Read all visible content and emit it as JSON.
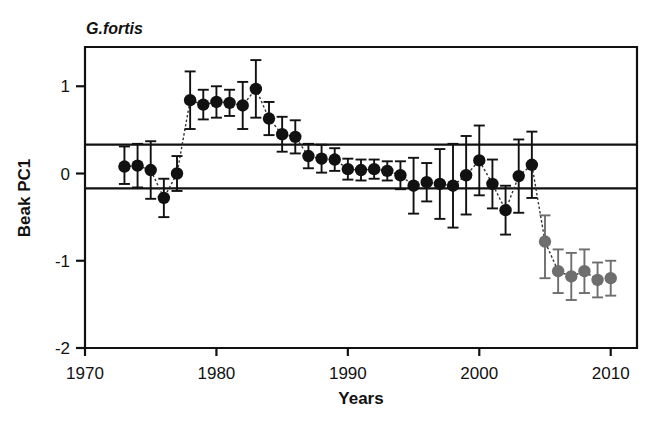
{
  "chart_data": {
    "type": "scatter",
    "title": "G.fortis",
    "xlabel": "Years",
    "ylabel": "Beak PC1",
    "xlim": [
      1970,
      2012
    ],
    "ylim": [
      -2,
      1.45
    ],
    "xticks": [
      1970,
      1980,
      1990,
      2000,
      2010
    ],
    "xtick_labels": [
      "1970",
      "1980",
      "1990",
      "2000",
      "2010"
    ],
    "yticks": [
      1,
      0,
      -1,
      -2
    ],
    "ytick_labels": [
      "1",
      "0",
      "-1",
      "-2"
    ],
    "grid": false,
    "legend": "none",
    "reference_lines": [
      {
        "name": "upper-reference-line",
        "y": 0.33
      },
      {
        "name": "lower-reference-line",
        "y": -0.17
      }
    ],
    "colors": {
      "marker_early": "#111111",
      "marker_late": "#6e6e6e",
      "axis": "#111111",
      "error_bar_early": "#111111",
      "error_bar_late": "#6e6e6e"
    },
    "series": [
      {
        "name": "Beak PC1 (pre-2005)",
        "color": "#111111",
        "x": [
          1973,
          1974,
          1975,
          1976,
          1977,
          1978,
          1979,
          1980,
          1981,
          1982,
          1983,
          1984,
          1985,
          1986,
          1987,
          1988,
          1989,
          1990,
          1991,
          1992,
          1993,
          1994,
          1995,
          1996,
          1997,
          1998,
          1999,
          2000,
          2001,
          2002,
          2003,
          2004
        ],
        "y": [
          0.08,
          0.09,
          0.04,
          -0.28,
          0.0,
          0.84,
          0.79,
          0.82,
          0.81,
          0.78,
          0.97,
          0.63,
          0.45,
          0.42,
          0.2,
          0.17,
          0.16,
          0.05,
          0.04,
          0.05,
          0.03,
          -0.02,
          -0.14,
          -0.1,
          -0.12,
          -0.14,
          -0.02,
          0.15,
          -0.12,
          -0.42,
          -0.03,
          0.1
        ],
        "yerr_up": [
          0.23,
          0.25,
          0.33,
          0.22,
          0.2,
          0.33,
          0.17,
          0.18,
          0.15,
          0.27,
          0.33,
          0.19,
          0.2,
          0.19,
          0.14,
          0.16,
          0.13,
          0.12,
          0.12,
          0.11,
          0.11,
          0.16,
          0.32,
          0.22,
          0.4,
          0.48,
          0.45,
          0.4,
          0.28,
          0.28,
          0.42,
          0.38
        ],
        "yerr_down": [
          0.2,
          0.25,
          0.33,
          0.22,
          0.2,
          0.33,
          0.17,
          0.18,
          0.15,
          0.27,
          0.33,
          0.19,
          0.2,
          0.19,
          0.14,
          0.16,
          0.13,
          0.12,
          0.12,
          0.11,
          0.11,
          0.16,
          0.32,
          0.22,
          0.4,
          0.48,
          0.45,
          0.4,
          0.28,
          0.28,
          0.42,
          0.38
        ]
      },
      {
        "name": "Beak PC1 (2005 onward)",
        "color": "#6e6e6e",
        "x": [
          2005,
          2006,
          2007,
          2008,
          2009,
          2010
        ],
        "y": [
          -0.78,
          -1.12,
          -1.18,
          -1.12,
          -1.22,
          -1.2
        ],
        "yerr_up": [
          0.3,
          0.25,
          0.27,
          0.25,
          0.2,
          0.2
        ],
        "yerr_down": [
          0.42,
          0.25,
          0.27,
          0.25,
          0.2,
          0.2
        ]
      }
    ]
  }
}
